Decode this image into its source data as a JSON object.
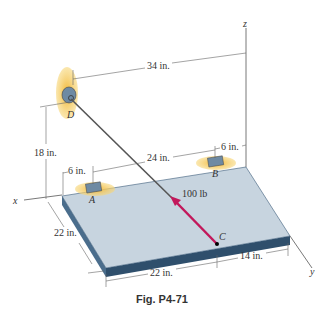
{
  "figure": {
    "caption": "Fig. P4-71",
    "colors": {
      "plate_top": "#c7d4df",
      "plate_edge": "#3a5a78",
      "force_arrow": "#c2185b",
      "wall_patch": "#f2b632",
      "cable": "#555555",
      "bracket": "#6e8aa3"
    },
    "axes": {
      "x": "x",
      "y": "y",
      "z": "z"
    },
    "points": {
      "A": "A",
      "B": "B",
      "C": "C",
      "D": "D"
    },
    "force": {
      "label": "100 lb"
    },
    "dimensions": {
      "d_to_z": "34 in.",
      "d_height": "18 in.",
      "a_to_b": "24 in.",
      "a_offset": "6 in.",
      "b_offset": "6 in.",
      "plate_depth": "22 in.",
      "c_from_left": "22 in.",
      "c_from_right": "14 in."
    }
  }
}
